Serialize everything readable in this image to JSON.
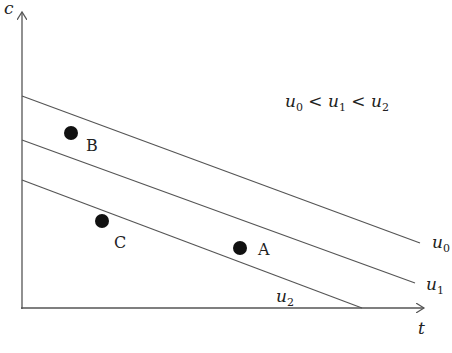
{
  "diagram": {
    "axes": {
      "x_label": "t",
      "y_label": "c"
    },
    "relation": {
      "parts": [
        "u",
        "0",
        " < ",
        "u",
        "1",
        " < ",
        "u",
        "2"
      ],
      "text": "u0 < u1 < u2"
    },
    "lines": [
      {
        "name": "u0",
        "base": "u",
        "sub": "0",
        "x1": 22,
        "y1": 96,
        "x2": 420,
        "y2": 243
      },
      {
        "name": "u1",
        "base": "u",
        "sub": "1",
        "x1": 22,
        "y1": 140,
        "x2": 415,
        "y2": 283
      },
      {
        "name": "u2",
        "base": "u",
        "sub": "2",
        "x1": 22,
        "y1": 180,
        "x2": 362,
        "y2": 308
      }
    ],
    "points": [
      {
        "label": "A",
        "cx": 240,
        "cy": 248
      },
      {
        "label": "B",
        "cx": 71,
        "cy": 133
      },
      {
        "label": "C",
        "cx": 102,
        "cy": 221
      }
    ],
    "colors": {
      "stroke": "#555555",
      "dot": "#111111",
      "text": "#222222"
    }
  }
}
